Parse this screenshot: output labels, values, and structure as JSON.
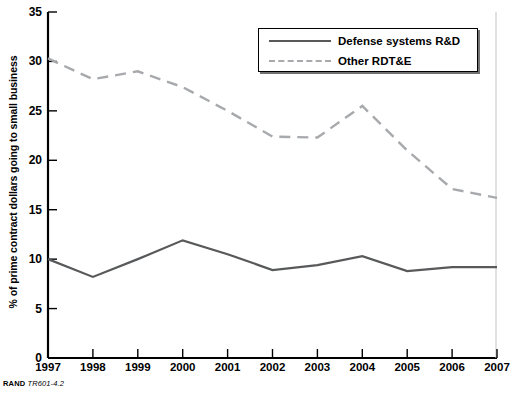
{
  "chart_data": {
    "type": "line",
    "title": "",
    "xlabel": "",
    "ylabel": "% of prime contract dollars going to small business",
    "categories": [
      "1997",
      "1998",
      "1999",
      "2000",
      "2001",
      "2002",
      "2003",
      "2004",
      "2005",
      "2006",
      "2007"
    ],
    "x": [
      1997,
      1998,
      1999,
      2000,
      2001,
      2002,
      2003,
      2004,
      2005,
      2006,
      2007
    ],
    "xlim": [
      1997,
      2007
    ],
    "ylim": [
      0,
      35
    ],
    "yticks": [
      0,
      5,
      10,
      15,
      20,
      25,
      30,
      35
    ],
    "grid": false,
    "legend_position": "top-right",
    "series": [
      {
        "name": "Defense systems R&D",
        "style": "solid",
        "color": "#58595b",
        "values": [
          10.0,
          8.2,
          10.0,
          11.9,
          10.5,
          8.9,
          9.4,
          10.3,
          8.8,
          9.2,
          9.2
        ]
      },
      {
        "name": "Other RDT&E",
        "style": "dashed",
        "color": "#a7a9ac",
        "values": [
          30.3,
          28.2,
          29.0,
          27.4,
          25.0,
          22.4,
          22.3,
          25.5,
          21.0,
          17.1,
          16.2
        ]
      }
    ]
  },
  "axis": {
    "y_label": "% of prime contract dollars going to small business",
    "y_tick_labels": [
      "0",
      "5",
      "10",
      "15",
      "20",
      "25",
      "30",
      "35"
    ],
    "x_tick_labels": [
      "1997",
      "1998",
      "1999",
      "2000",
      "2001",
      "2002",
      "2003",
      "2004",
      "2005",
      "2006",
      "2007"
    ]
  },
  "legend": {
    "items": [
      {
        "label": "Defense systems R&D",
        "style": "solid"
      },
      {
        "label": "Other RDT&E",
        "style": "dashed"
      }
    ]
  },
  "footer": {
    "brand": "RAND",
    "code": "TR601-4.2"
  },
  "colors": {
    "series_solid": "#58595b",
    "series_dashed": "#a7a9ac",
    "axis": "#000000",
    "background": "#ffffff"
  }
}
